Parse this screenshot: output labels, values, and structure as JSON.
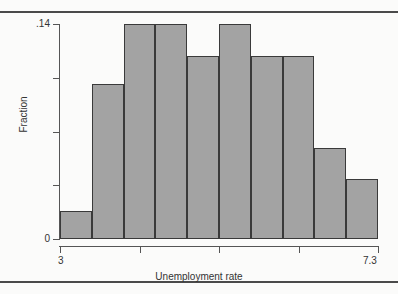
{
  "chart_data": {
    "type": "bar",
    "title": "",
    "xlabel": "Unemployment rate",
    "ylabel": "Fraction",
    "categories": [
      "3-3.43",
      "3.43-3.86",
      "3.86-4.29",
      "4.29-4.72",
      "4.72-5.15",
      "5.15-5.58",
      "5.58-6.01",
      "6.01-6.44",
      "6.44-6.87",
      "6.87-7.3"
    ],
    "values": [
      0.018,
      0.101,
      0.14,
      0.14,
      0.119,
      0.14,
      0.119,
      0.119,
      0.059,
      0.039
    ],
    "bin_edges": [
      3,
      3.43,
      3.86,
      4.29,
      4.72,
      5.15,
      5.58,
      6.01,
      6.44,
      6.87,
      7.3
    ],
    "xlim": [
      3,
      7.3
    ],
    "ylim": [
      0,
      0.14
    ],
    "x_tick_labels": [
      "3",
      "7.3"
    ],
    "x_tick_values": [
      3,
      7.3
    ],
    "x_minor_tick_values": [
      3,
      4.075,
      5.15,
      6.225,
      7.3
    ],
    "y_tick_labels": [
      "0",
      ".14"
    ],
    "y_tick_values": [
      0,
      0.14
    ],
    "y_minor_tick_values": [
      0,
      0.035,
      0.07,
      0.105,
      0.14
    ],
    "grid": false,
    "legend": "none",
    "bar_fill_color": "#a3a3a3",
    "bar_border_color": "#3a3a3a",
    "axis_color": "#555555",
    "background_color": "#fbfbfa"
  },
  "page": {
    "rule_top": "",
    "rule_bottom": "",
    "bleed_lines": [
      "",
      "",
      "",
      ""
    ]
  }
}
